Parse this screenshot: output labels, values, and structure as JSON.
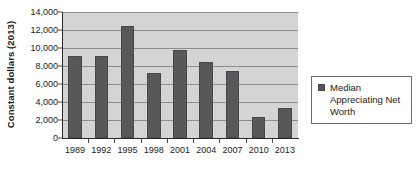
{
  "chart_data": {
    "type": "bar",
    "title": "",
    "xlabel": "",
    "ylabel": "Constant dollars (2013)",
    "categories": [
      "1989",
      "1992",
      "1995",
      "1998",
      "2001",
      "2004",
      "2007",
      "2010",
      "2013"
    ],
    "values": [
      9100,
      9100,
      12450,
      7200,
      9800,
      8400,
      7500,
      2300,
      3350
    ],
    "series": [
      {
        "name": "Median Appreciating Net Worth",
        "values": [
          9100,
          9100,
          12450,
          7200,
          9800,
          8400,
          7500,
          2300,
          3350
        ]
      }
    ],
    "ylim": [
      0,
      14000
    ],
    "ytick_values": [
      0,
      2000,
      4000,
      6000,
      8000,
      10000,
      12000,
      14000
    ],
    "ytick_labels": [
      "0",
      "2,000",
      "4,000",
      "6,000",
      "8,000",
      "10,000",
      "12,000",
      "14,000"
    ],
    "grid": true,
    "legend_position": "right",
    "legend": [
      "Median Appreciating Net Worth"
    ],
    "colors": {
      "bar": "#58585a",
      "plot_background": "#d4d4d4",
      "gridline": "#8d8d8d",
      "axis": "#2b2b2b",
      "text": "#1b1b1b",
      "legend_border": "#6e6e6e",
      "page_background": "#ffffff"
    }
  },
  "legend": {
    "entry_label": "Median Appreciating Net Worth"
  }
}
